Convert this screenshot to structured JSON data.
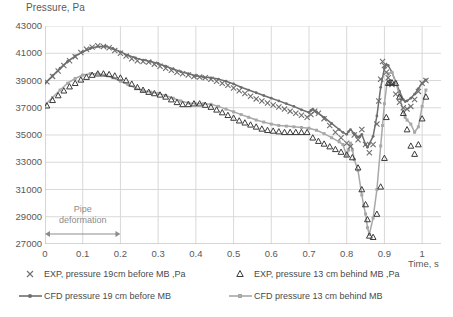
{
  "chart_data": {
    "type": "line",
    "title": "",
    "xlabel": "Time, s",
    "ylabel": "Pressure, Pa",
    "xlim": [
      0,
      1.05
    ],
    "ylim": [
      27000,
      43000
    ],
    "xticks": [
      "0",
      "0.1",
      "0.2",
      "0.3",
      "0.4",
      "0.5",
      "0.6",
      "0.7",
      "0.8",
      "0.9",
      "1"
    ],
    "xtick_values": [
      0,
      0.1,
      0.2,
      0.3,
      0.4,
      0.5,
      0.6,
      0.7,
      0.8,
      0.9,
      1
    ],
    "yticks": [
      "27000",
      "29000",
      "31000",
      "33000",
      "35000",
      "37000",
      "39000",
      "41000",
      "43000"
    ],
    "ytick_values": [
      27000,
      29000,
      31000,
      33000,
      35000,
      37000,
      39000,
      41000,
      43000
    ],
    "grid": "both",
    "legend_position": "bottom",
    "annotations": [
      {
        "text": "Pipe deformation",
        "x_start": 0.0,
        "x_end": 0.2,
        "y": 28000,
        "style": "double-arrow"
      }
    ],
    "series": [
      {
        "name": "EXP, pressure 19cm before MB ,Pa",
        "marker": "x",
        "color": "#6e6e6e",
        "line": false,
        "x": [
          0.005,
          0.02,
          0.035,
          0.05,
          0.065,
          0.08,
          0.095,
          0.11,
          0.125,
          0.14,
          0.155,
          0.17,
          0.185,
          0.2,
          0.215,
          0.23,
          0.245,
          0.26,
          0.275,
          0.29,
          0.305,
          0.32,
          0.335,
          0.35,
          0.365,
          0.38,
          0.395,
          0.41,
          0.425,
          0.44,
          0.455,
          0.47,
          0.485,
          0.5,
          0.515,
          0.53,
          0.545,
          0.56,
          0.575,
          0.59,
          0.605,
          0.62,
          0.635,
          0.65,
          0.665,
          0.68,
          0.695,
          0.705,
          0.715,
          0.725,
          0.74,
          0.755,
          0.77,
          0.785,
          0.8,
          0.81,
          0.82,
          0.83,
          0.84,
          0.85,
          0.86,
          0.87,
          0.88,
          0.885,
          0.89,
          0.895,
          0.9,
          0.905,
          0.91,
          0.92,
          0.93,
          0.94,
          0.95,
          0.96,
          0.97,
          0.98,
          0.99,
          1.0,
          1.01
        ],
        "y": [
          38900,
          39300,
          39700,
          40100,
          40450,
          40750,
          41050,
          41300,
          41450,
          41550,
          41500,
          41400,
          41200,
          41000,
          40800,
          40600,
          40450,
          40400,
          40350,
          40200,
          40050,
          39900,
          39750,
          39600,
          39500,
          39400,
          39300,
          39250,
          39200,
          39100,
          38950,
          38800,
          38650,
          38450,
          38250,
          38050,
          37850,
          37650,
          37500,
          37350,
          37200,
          37050,
          36900,
          36750,
          36600,
          36450,
          36300,
          36500,
          36750,
          36600,
          36200,
          35700,
          35200,
          34800,
          34400,
          34150,
          35000,
          34650,
          35400,
          34300,
          33700,
          34300,
          35800,
          37500,
          39100,
          40400,
          40100,
          39600,
          39200,
          38700,
          38000,
          37400,
          37000,
          36900,
          37100,
          37600,
          38200,
          38800,
          39000
        ]
      },
      {
        "name": "EXP, pressure 13 cm behind MB ,Pa",
        "marker": "triangle",
        "color": "#3a3a3a",
        "line": false,
        "x": [
          0.005,
          0.02,
          0.035,
          0.05,
          0.065,
          0.08,
          0.095,
          0.11,
          0.125,
          0.14,
          0.155,
          0.17,
          0.185,
          0.2,
          0.215,
          0.23,
          0.245,
          0.26,
          0.275,
          0.29,
          0.305,
          0.32,
          0.335,
          0.35,
          0.365,
          0.38,
          0.395,
          0.41,
          0.425,
          0.44,
          0.455,
          0.47,
          0.485,
          0.5,
          0.515,
          0.53,
          0.545,
          0.56,
          0.575,
          0.59,
          0.605,
          0.62,
          0.635,
          0.65,
          0.665,
          0.68,
          0.695,
          0.71,
          0.725,
          0.74,
          0.755,
          0.77,
          0.785,
          0.8,
          0.815,
          0.83,
          0.84,
          0.85,
          0.855,
          0.86,
          0.87,
          0.88,
          0.89,
          0.9,
          0.905,
          0.91,
          0.915,
          0.92,
          0.93,
          0.94,
          0.95,
          0.96,
          0.97,
          0.98,
          0.99,
          1.0,
          1.01
        ],
        "y": [
          37150,
          37550,
          37900,
          38250,
          38550,
          38800,
          39050,
          39250,
          39400,
          39500,
          39500,
          39450,
          39350,
          39200,
          39000,
          38750,
          38500,
          38300,
          38150,
          38050,
          37950,
          37800,
          37600,
          37400,
          37250,
          37250,
          37300,
          37300,
          37200,
          37050,
          36850,
          36650,
          36450,
          36250,
          36050,
          35900,
          35750,
          35600,
          35450,
          35350,
          35300,
          35250,
          35200,
          35200,
          35200,
          35200,
          35200,
          34800,
          34550,
          34350,
          34150,
          33950,
          33750,
          33550,
          33350,
          32600,
          31000,
          29900,
          28800,
          27600,
          27500,
          29200,
          31200,
          33300,
          36300,
          38800,
          38850,
          38850,
          38800,
          37800,
          36600,
          35400,
          34200,
          33600,
          34300,
          36200,
          37800
        ]
      },
      {
        "name": "CFD pressure 19 cm before MB",
        "marker": "small-dot",
        "color": "#6e6e6e",
        "line": true,
        "x": [
          0.0,
          0.02,
          0.04,
          0.06,
          0.08,
          0.1,
          0.12,
          0.14,
          0.16,
          0.18,
          0.2,
          0.22,
          0.24,
          0.26,
          0.28,
          0.3,
          0.32,
          0.34,
          0.36,
          0.38,
          0.4,
          0.42,
          0.44,
          0.46,
          0.48,
          0.5,
          0.52,
          0.54,
          0.56,
          0.58,
          0.6,
          0.62,
          0.64,
          0.66,
          0.68,
          0.7,
          0.705,
          0.71,
          0.72,
          0.74,
          0.76,
          0.78,
          0.79,
          0.8,
          0.805,
          0.81,
          0.82,
          0.83,
          0.835,
          0.84,
          0.85,
          0.855,
          0.86,
          0.87,
          0.88,
          0.89,
          0.9,
          0.905,
          0.91,
          0.92,
          0.93,
          0.94,
          0.95,
          0.955,
          0.96,
          0.97,
          0.98,
          0.99,
          1.0,
          1.01
        ],
        "y": [
          38800,
          39350,
          39900,
          40400,
          40800,
          41100,
          41350,
          41500,
          41500,
          41350,
          41100,
          40850,
          40650,
          40500,
          40400,
          40250,
          40050,
          39850,
          39650,
          39500,
          39350,
          39250,
          39200,
          39100,
          38950,
          38750,
          38500,
          38300,
          38100,
          37900,
          37700,
          37500,
          37300,
          37100,
          36850,
          36650,
          36800,
          36900,
          36700,
          36300,
          35850,
          35400,
          35200,
          35050,
          35250,
          35400,
          35100,
          34850,
          34900,
          35050,
          34300,
          34100,
          34350,
          34900,
          36400,
          38500,
          39900,
          40150,
          40100,
          39600,
          38900,
          38200,
          37600,
          37450,
          37500,
          37700,
          38000,
          38400,
          38800,
          39050
        ]
      },
      {
        "name": "CFD pressure 13 cm behind MB",
        "marker": "small-square",
        "color": "#a8a8a8",
        "line": true,
        "x": [
          0.0,
          0.02,
          0.04,
          0.06,
          0.08,
          0.1,
          0.12,
          0.14,
          0.16,
          0.18,
          0.2,
          0.22,
          0.24,
          0.26,
          0.28,
          0.3,
          0.32,
          0.34,
          0.36,
          0.38,
          0.4,
          0.42,
          0.44,
          0.46,
          0.48,
          0.5,
          0.52,
          0.54,
          0.56,
          0.58,
          0.6,
          0.62,
          0.64,
          0.66,
          0.68,
          0.7,
          0.72,
          0.74,
          0.76,
          0.78,
          0.79,
          0.8,
          0.805,
          0.81,
          0.815,
          0.82,
          0.83,
          0.84,
          0.845,
          0.85,
          0.855,
          0.86,
          0.87,
          0.88,
          0.89,
          0.895,
          0.9,
          0.91,
          0.92,
          0.93,
          0.94,
          0.95,
          0.955,
          0.96,
          0.97,
          0.98,
          0.99,
          1.0,
          1.01
        ],
        "y": [
          37200,
          37750,
          38300,
          38800,
          39150,
          39400,
          39500,
          39500,
          39400,
          39200,
          38950,
          38700,
          38450,
          38250,
          38150,
          38050,
          37900,
          37700,
          37500,
          37350,
          37300,
          37300,
          37250,
          37100,
          36900,
          36700,
          36500,
          36300,
          36100,
          35950,
          35800,
          35700,
          35650,
          35600,
          35550,
          35500,
          35350,
          35100,
          34800,
          34500,
          34300,
          33500,
          33900,
          34400,
          33900,
          33200,
          32400,
          30600,
          29800,
          29200,
          28200,
          27700,
          28900,
          31000,
          34200,
          35700,
          37300,
          39500,
          39600,
          38900,
          37900,
          36700,
          36300,
          36100,
          35800,
          35200,
          35600,
          37100,
          38300
        ]
      }
    ]
  },
  "legend": [
    {
      "label": "EXP, pressure 19cm before MB ,Pa",
      "marker": "x",
      "color": "#6e6e6e"
    },
    {
      "label": "EXP, pressure 13 cm behind MB ,Pa",
      "marker": "triangle",
      "color": "#3a3a3a"
    },
    {
      "label": "CFD pressure 19 cm before MB",
      "marker": "line-dot",
      "color": "#6e6e6e"
    },
    {
      "label": "CFD pressure 13 cm behind MB",
      "marker": "line-square",
      "color": "#a8a8a8"
    }
  ],
  "colors": {
    "grid": "#d9d9d9",
    "axis": "#bfbfbf",
    "text": "#595959",
    "annotation": "#8c8c8c",
    "exp_before": "#6e6e6e",
    "exp_behind": "#3a3a3a",
    "cfd_before": "#6e6e6e",
    "cfd_behind": "#a8a8a8"
  }
}
